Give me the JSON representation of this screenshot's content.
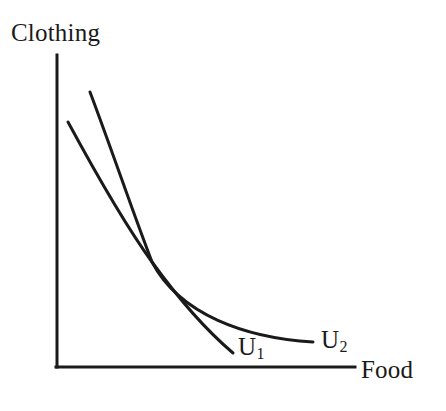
{
  "figure": {
    "background_color": "#ffffff",
    "ink_color": "#1a1a1a"
  },
  "axes": {
    "y_label": "Clothing",
    "x_label": "Food",
    "origin": {
      "x": 57,
      "y": 367
    },
    "y_axis_top": {
      "x": 57,
      "y": 55
    },
    "x_axis_right": {
      "x": 355,
      "y": 367
    },
    "line_width": 3,
    "ticks": [],
    "gridlines": false
  },
  "curves": [
    {
      "id": "U1",
      "label": "U",
      "subscript": "1",
      "label_position": {
        "x": 238,
        "y": 334
      },
      "start": {
        "x": 68,
        "y": 122
      },
      "end": {
        "x": 233,
        "y": 353
      },
      "path": "M 68 122 C 108 196, 131 233, 152 262 C 178 298, 206 330, 233 353",
      "line_width": 3,
      "description": "lower indifference curve, steeper after crossing"
    },
    {
      "id": "U2",
      "label": "U",
      "subscript": "2",
      "label_position": {
        "x": 321,
        "y": 327
      },
      "start": {
        "x": 90,
        "y": 92
      },
      "end": {
        "x": 313,
        "y": 342
      },
      "path": "M 90 92 C 114 156, 132 210, 152 262 C 180 315, 246 338, 313 342",
      "line_width": 3,
      "description": "upper indifference curve, flatter after crossing"
    }
  ],
  "intersection": {
    "x": 152,
    "y": 262,
    "visible": true
  },
  "chart_data": {
    "type": "line",
    "title": "",
    "xlabel": "Food",
    "ylabel": "Clothing",
    "xlim": [
      0,
      100
    ],
    "ylim": [
      0,
      100
    ],
    "grid": false,
    "legend": "inline-curve-labels",
    "annotations": [
      "U1",
      "U2"
    ],
    "series": [
      {
        "name": "U1",
        "x": [
          3.7,
          10,
          18,
          26,
          32,
          40,
          49,
          59
        ],
        "y": [
          78.5,
          64,
          52,
          42,
          36.5,
          29,
          19,
          4.5
        ]
      },
      {
        "name": "U2",
        "x": [
          11,
          18,
          26,
          32,
          45,
          58,
          72,
          86
        ],
        "y": [
          88,
          72,
          58,
          48,
          33,
          25,
          18,
          8
        ]
      }
    ]
  }
}
